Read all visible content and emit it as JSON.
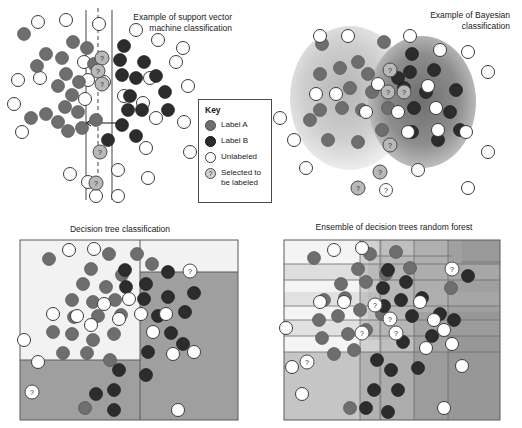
{
  "figure": {
    "background": "#ffffff"
  },
  "colors": {
    "label_a": "#6e6e6e",
    "label_b": "#2c2c2c",
    "unlabeled": "#ffffff",
    "selected": "#b9b9b9",
    "outline": "#4a4a4a",
    "region_light": "#f0f0f0",
    "region_mid": "#c9c9c9",
    "region_dark": "#9a9a9a"
  },
  "key": {
    "title": "Key",
    "items": [
      {
        "swatch": "label-a-dot",
        "label": "Label A"
      },
      {
        "swatch": "label-b-dot",
        "label": "Label B"
      },
      {
        "swatch": "unlabeled-dot",
        "label": "Unlabeled"
      },
      {
        "swatch": "selected-dot",
        "label": "Selected to be labeled",
        "glyph": "?"
      }
    ]
  },
  "panels": [
    {
      "id": "svm",
      "title": "Example of support vector\nmachine classification",
      "title_align": "right",
      "description": "Support vector machine with separating hyperplane and margins",
      "hyperplane": {
        "decision_boundary": "dashed",
        "margins": 2,
        "arrow": "margin-width-arrow"
      },
      "points": {
        "label_a": [
          [
            22,
            35
          ],
          [
            35,
            66
          ],
          [
            45,
            52
          ],
          [
            60,
            57
          ],
          [
            64,
            72
          ],
          [
            58,
            85
          ],
          [
            69,
            96
          ],
          [
            78,
            80
          ],
          [
            72,
            40
          ],
          [
            86,
            47
          ],
          [
            90,
            60
          ],
          [
            88,
            70
          ],
          [
            30,
            118
          ],
          [
            44,
            114
          ],
          [
            56,
            122
          ],
          [
            64,
            107
          ],
          [
            66,
            130
          ],
          [
            86,
            110
          ],
          [
            96,
            118
          ],
          [
            96,
            62
          ],
          [
            80,
            128
          ]
        ],
        "label_b": [
          [
            116,
            45
          ],
          [
            128,
            58
          ],
          [
            120,
            68
          ],
          [
            112,
            77
          ],
          [
            130,
            77
          ],
          [
            140,
            62
          ],
          [
            152,
            74
          ],
          [
            128,
            95
          ],
          [
            122,
            110
          ],
          [
            140,
            108
          ],
          [
            152,
            120
          ],
          [
            160,
            92
          ],
          [
            168,
            108
          ],
          [
            108,
            140
          ],
          [
            134,
            136
          ],
          [
            118,
            52
          ]
        ],
        "unlabeled": [
          [
            38,
            22
          ],
          [
            62,
            20
          ],
          [
            96,
            24
          ],
          [
            104,
            32
          ],
          [
            132,
            34
          ],
          [
            150,
            44
          ],
          [
            18,
            78
          ],
          [
            36,
            76
          ],
          [
            62,
            92
          ],
          [
            82,
            96
          ],
          [
            108,
            88
          ],
          [
            150,
            88
          ],
          [
            176,
            56
          ],
          [
            180,
            74
          ],
          [
            172,
            38
          ],
          [
            14,
            102
          ],
          [
            20,
            134
          ],
          [
            88,
            144
          ],
          [
            112,
            150
          ],
          [
            160,
            138
          ],
          [
            176,
            116
          ],
          [
            186,
            152
          ],
          [
            70,
            172
          ],
          [
            94,
            182
          ],
          [
            124,
            170
          ],
          [
            150,
            176
          ],
          [
            100,
            196
          ],
          [
            120,
            196
          ],
          [
            78,
            198
          ]
        ],
        "selected": [
          [
            104,
            58
          ],
          [
            100,
            70
          ],
          [
            104,
            82
          ],
          [
            102,
            152
          ],
          [
            98,
            182
          ]
        ]
      }
    },
    {
      "id": "bayesian",
      "title": "Example of Bayesian\nclassification",
      "title_align": "right",
      "description": "Two overlapping Gaussian class-conditional density ellipses",
      "clusters": [
        {
          "name": "Label A cluster",
          "shade": "light"
        },
        {
          "name": "Label B cluster",
          "shade": "dark"
        }
      ]
    },
    {
      "id": "decision-tree",
      "title": "Decision tree classification",
      "title_align": "center",
      "description": "Axis-aligned rectangular partitions from a single decision tree",
      "splits": 3
    },
    {
      "id": "random-forest",
      "title": "Ensemble of decision trees random forest",
      "title_align": "center",
      "description": "Overlaid partitions from an ensemble of decision trees",
      "splits": 12
    }
  ]
}
